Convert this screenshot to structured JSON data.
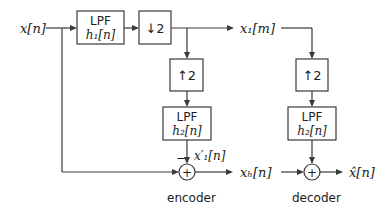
{
  "diagram": {
    "input": {
      "label": "x[n]"
    },
    "encoder": {
      "caption": "encoder",
      "lpf1": {
        "title": "LPF",
        "filter": "h₁[n]"
      },
      "downsample": {
        "label": "↓2"
      },
      "upsample": {
        "label": "↑2"
      },
      "lpf2": {
        "title": "LPF",
        "filter": "h₂[n]"
      },
      "lowband_output": {
        "label": "x₁[m]"
      },
      "interp_signal": {
        "label": "x′₁[n]"
      },
      "sum_sign": "−",
      "sum_symbol": "+",
      "highband_output": {
        "label": "xₕ[n]"
      }
    },
    "decoder": {
      "caption": "decoder",
      "upsample": {
        "label": "↑2"
      },
      "lpf2": {
        "title": "LPF",
        "filter": "h₂[n]"
      },
      "sum_symbol": "+",
      "output": {
        "label": "x̂[n]"
      }
    },
    "colors": {
      "line": "#3a3a3a",
      "text": "#222222",
      "background": "#ffffff"
    }
  }
}
